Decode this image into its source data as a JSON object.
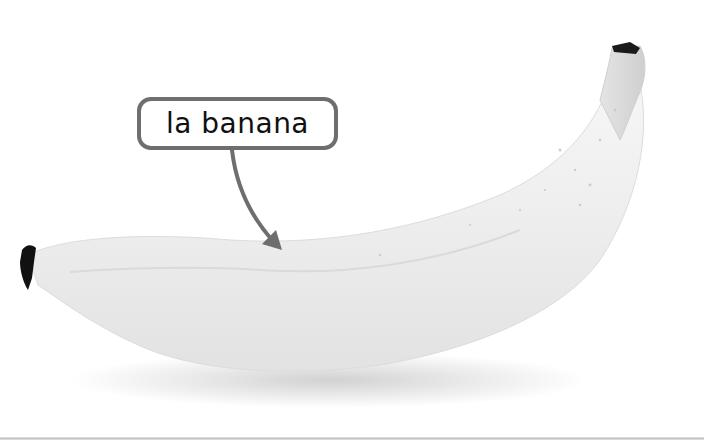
{
  "image": {
    "subject": "banana",
    "style": "grayscale photo on white background"
  },
  "callout": {
    "label": "la banana",
    "border_color": "#6e6e6e",
    "text_color": "#111111"
  },
  "arrow": {
    "color": "#6e6e6e"
  },
  "colors": {
    "background": "#ffffff",
    "banana_body": "#eeeeee",
    "banana_shadow": "#d8d8d8",
    "banana_tip": "#111111",
    "bottom_rule": "#c8c8c8"
  }
}
